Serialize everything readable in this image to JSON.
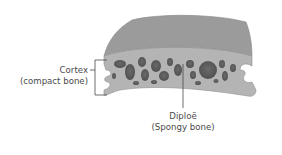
{
  "diagram": {
    "colors": {
      "outer_surface": "#9b9b9b",
      "cut_face": "#b4b4b4",
      "pores": "#5e5e5e",
      "leader_lines": "#4a4a4a",
      "text": "#4a4a4a"
    },
    "labels": {
      "cortex": {
        "line1": "Cortex",
        "line2": "(compact bone)"
      },
      "diploe": {
        "line1": "Diploë",
        "line2": "(Spongy bone)"
      }
    }
  }
}
